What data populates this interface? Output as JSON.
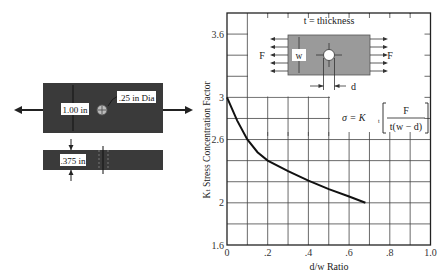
{
  "left_diagram": {
    "width_label": "1.00 in",
    "hole_label": ".25 in Dia",
    "thickness_label": ".375 in",
    "plate_color": "#3a3a3a"
  },
  "inset": {
    "thickness_label": "t = thickness",
    "force_left": "F",
    "force_right": "F",
    "width_symbol": "w",
    "diameter_symbol": "d",
    "formula_lhs": "σ = K",
    "formula_sub": "t",
    "formula_num": "F",
    "formula_den": "t(w − d)"
  },
  "chart_data": {
    "type": "line",
    "title": "",
    "xlabel": "d/w Ratio",
    "ylabel": "Kₜ Stress Concentration Factor",
    "xlim": [
      0,
      1.0
    ],
    "ylim": [
      1.6,
      3.8
    ],
    "x_ticks": [
      "0",
      ".2",
      ".4",
      ".6",
      ".8",
      "1.0"
    ],
    "y_ticks": [
      "1.6",
      "2",
      "2.6",
      "3",
      "3.6"
    ],
    "grid": true,
    "series": [
      {
        "name": "Kt",
        "x": [
          0,
          0.05,
          0.1,
          0.15,
          0.2,
          0.3,
          0.4,
          0.5,
          0.6,
          0.68
        ],
        "values": [
          3.0,
          2.78,
          2.6,
          2.48,
          2.4,
          2.3,
          2.21,
          2.13,
          2.06,
          2.0
        ]
      }
    ]
  }
}
